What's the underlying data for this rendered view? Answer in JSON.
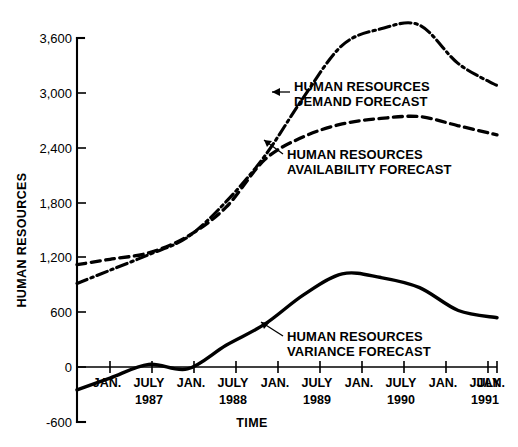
{
  "figure": {
    "x_axis_title": "TIME",
    "y_axis_title": "HUMAN RESOURCES"
  },
  "annotations": {
    "demand": {
      "line1": "HUMAN RESOURCES",
      "line2": "DEMAND FORECAST"
    },
    "availability": {
      "line1": "HUMAN RESOURCES",
      "line2": "AVAILABILITY FORECAST"
    },
    "variance": {
      "line1": "HUMAN RESOURCES",
      "line2": "VARIANCE FORECAST"
    }
  },
  "chart_data": {
    "type": "line",
    "title": "",
    "xlabel": "TIME",
    "ylabel": "HUMAN RESOURCES",
    "ylim": [
      -600,
      3600
    ],
    "yticks": [
      -600,
      0,
      600,
      1200,
      1800,
      2400,
      3000,
      3600
    ],
    "ytick_labels": [
      "-600",
      "0",
      "600",
      "1,200",
      "1,800",
      "2,400",
      "3,000",
      "3,600"
    ],
    "grid": false,
    "legend_position": "inline-annotations",
    "xtick_labels": [
      "JAN.",
      "JULY",
      "JAN.",
      "JULY",
      "JAN.",
      "JULY",
      "JAN.",
      "JULY",
      "JAN.",
      "JULY",
      "JAN."
    ],
    "year_labels": [
      "1987",
      "1988",
      "1989",
      "1990",
      "1991"
    ],
    "year_label_positions": [
      1,
      3,
      5,
      7,
      9
    ],
    "x": [
      0,
      1,
      2,
      3,
      4,
      5,
      6,
      7,
      8,
      9,
      10
    ],
    "series": [
      {
        "name": "HUMAN RESOURCES DEMAND FORECAST",
        "style": "dash-dot",
        "values": [
          1060,
          1230,
          1420,
          1810,
          2310,
          2950,
          3520,
          3700,
          3740,
          3320,
          3080
        ]
      },
      {
        "name": "HUMAN RESOURCES AVAILABILITY FORECAST",
        "style": "dashed",
        "values": [
          1180,
          1250,
          1430,
          1750,
          2270,
          2520,
          2660,
          2720,
          2740,
          2640,
          2540
        ]
      },
      {
        "name": "HUMAN RESOURCES VARIANCE FORECAST",
        "style": "solid",
        "values": [
          -120,
          30,
          -20,
          240,
          470,
          790,
          1020,
          980,
          870,
          620,
          540
        ]
      }
    ]
  }
}
